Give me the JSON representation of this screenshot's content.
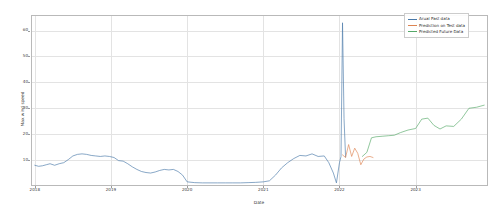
{
  "figure": {
    "background": "#ffffff",
    "axes_edge_color": "#b9b9b9",
    "grid_color": "#e3e3e3"
  },
  "axis": {
    "ylabel": "Max wind speed",
    "xlabel": "Date",
    "yticks": [
      "10",
      "20",
      "30",
      "40",
      "50",
      "60"
    ],
    "ytick_values": [
      10,
      20,
      30,
      40,
      50,
      60
    ],
    "xticks": [
      "2018",
      "2019",
      "2020",
      "2021",
      "2022",
      "2023"
    ],
    "xtick_values": [
      2018,
      2019,
      2020,
      2021,
      2022,
      2023
    ]
  },
  "legend": {
    "position": "upper right",
    "items": [
      {
        "label": "Arual Past data",
        "color": "#4878a8"
      },
      {
        "label": "Prediction on Test data",
        "color": "#dd8452"
      },
      {
        "label": "Predicted Future Data",
        "color": "#55a868"
      }
    ]
  },
  "chart_data": {
    "type": "line",
    "title": "",
    "xlabel": "Date",
    "ylabel": "Max wind speed",
    "xlim": [
      2017.95,
      2023.95
    ],
    "ylim": [
      0,
      66
    ],
    "grid": true,
    "legend_position": "upper right",
    "xtick_labels": [
      "2018",
      "2019",
      "2020",
      "2021",
      "2022",
      "2023"
    ],
    "ytick_labels": [
      "10",
      "20",
      "30",
      "40",
      "50",
      "60"
    ],
    "series": [
      {
        "name": "Arual Past data",
        "color": "#4878a8",
        "x": [
          2018.0,
          2018.05,
          2018.1,
          2018.15,
          2018.2,
          2018.26,
          2018.32,
          2018.38,
          2018.44,
          2018.5,
          2018.56,
          2018.62,
          2018.68,
          2018.74,
          2018.8,
          2018.86,
          2018.92,
          2018.98,
          2019.04,
          2019.1,
          2019.16,
          2019.22,
          2019.28,
          2019.34,
          2019.4,
          2019.46,
          2019.52,
          2019.58,
          2019.64,
          2019.7,
          2019.76,
          2019.82,
          2019.88,
          2019.94,
          2020.0,
          2020.1,
          2020.2,
          2020.3,
          2020.4,
          2020.5,
          2020.6,
          2020.7,
          2020.8,
          2020.9,
          2021.0,
          2021.08,
          2021.16,
          2021.24,
          2021.32,
          2021.4,
          2021.48,
          2021.56,
          2021.64,
          2021.72,
          2021.8,
          2021.86,
          2021.92,
          2021.96,
          2022.0,
          2022.02,
          2022.04,
          2022.06,
          2022.08
        ],
        "y": [
          8.0,
          7.6,
          7.8,
          8.2,
          8.6,
          8.0,
          8.6,
          9.0,
          10.2,
          11.6,
          12.2,
          12.4,
          12.2,
          11.8,
          11.6,
          11.4,
          11.6,
          11.4,
          11.0,
          9.8,
          9.6,
          8.6,
          7.4,
          6.4,
          5.6,
          5.2,
          5.0,
          5.4,
          6.0,
          6.4,
          6.2,
          6.4,
          5.6,
          4.2,
          1.6,
          1.3,
          1.2,
          1.2,
          1.2,
          1.2,
          1.2,
          1.2,
          1.3,
          1.4,
          1.6,
          2.0,
          4.2,
          7.0,
          9.0,
          10.6,
          11.8,
          11.6,
          12.4,
          11.4,
          11.6,
          9.0,
          5.0,
          1.2,
          9.0,
          11.4,
          63.0,
          26.0,
          11.2
        ]
      },
      {
        "name": "Prediction on Test data",
        "color": "#dd8452",
        "x": [
          2022.04,
          2022.08,
          2022.12,
          2022.16,
          2022.2,
          2022.24,
          2022.28,
          2022.32,
          2022.36,
          2022.4,
          2022.44
        ],
        "y": [
          12.0,
          11.0,
          16.0,
          11.4,
          14.6,
          12.6,
          8.2,
          10.4,
          11.2,
          11.4,
          11.0
        ]
      },
      {
        "name": "Predicted Future Data",
        "color": "#55a868",
        "x": [
          2022.3,
          2022.36,
          2022.42,
          2022.48,
          2022.56,
          2022.64,
          2022.72,
          2022.8,
          2022.9,
          2023.0,
          2023.08,
          2023.16,
          2023.24,
          2023.32,
          2023.4,
          2023.5,
          2023.6,
          2023.7,
          2023.8,
          2023.9
        ],
        "y": [
          11.4,
          13.0,
          18.6,
          19.0,
          19.2,
          19.4,
          19.6,
          20.6,
          21.6,
          22.2,
          25.8,
          26.2,
          23.4,
          22.0,
          23.2,
          23.0,
          25.8,
          30.0,
          30.4,
          31.2
        ]
      }
    ]
  }
}
